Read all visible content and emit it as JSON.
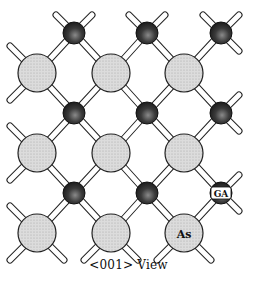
{
  "figure": {
    "caption": "<001> View",
    "labels": {
      "ga": "GA",
      "as": "As"
    },
    "colors": {
      "large_atom_fill": "#d8d8d8",
      "small_atom_fill": "#2a2a2a",
      "bond_fill": "#ffffff",
      "outline": "#222222"
    }
  },
  "lattice": {
    "large_atoms": [
      {
        "x": 37,
        "y": 73
      },
      {
        "x": 111,
        "y": 73
      },
      {
        "x": 184,
        "y": 73
      },
      {
        "x": 37,
        "y": 153
      },
      {
        "x": 111,
        "y": 153
      },
      {
        "x": 184,
        "y": 153
      },
      {
        "x": 37,
        "y": 233
      },
      {
        "x": 111,
        "y": 233
      },
      {
        "x": 184,
        "y": 233,
        "label": "As"
      }
    ],
    "small_atoms": [
      {
        "x": 74,
        "y": 33
      },
      {
        "x": 147,
        "y": 33
      },
      {
        "x": 221,
        "y": 33
      },
      {
        "x": 74,
        "y": 113
      },
      {
        "x": 147,
        "y": 113
      },
      {
        "x": 221,
        "y": 113
      },
      {
        "x": 74,
        "y": 193
      },
      {
        "x": 147,
        "y": 193
      },
      {
        "x": 221,
        "y": 193,
        "label": "GA"
      }
    ]
  }
}
